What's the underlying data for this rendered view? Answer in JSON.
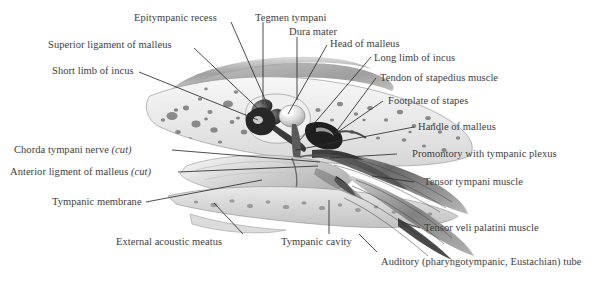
{
  "figure": {
    "kind": "anatomical-illustration",
    "style": "grayscale pen-and-wash medical drawing",
    "background_color": "#ffffff",
    "text_color": "#3d3d3d",
    "leader_line_color": "#2e2e2e"
  },
  "labels": [
    {
      "id": "epitympanic-recess",
      "text": "Epitympanic recess"
    },
    {
      "id": "tegmen-tympani",
      "text": "Tegmen tympani"
    },
    {
      "id": "dura-mater",
      "text": "Dura mater"
    },
    {
      "id": "head-of-malleus",
      "text": "Head of malleus"
    },
    {
      "id": "superior-ligament-of-malleus",
      "text": "Superior ligament of malleus"
    },
    {
      "id": "long-limb-of-incus",
      "text": "Long limb of incus"
    },
    {
      "id": "short-limb-of-incus",
      "text": "Short limb of incus"
    },
    {
      "id": "tendon-of-stapedius-muscle",
      "text": "Tendon of stapedius muscle"
    },
    {
      "id": "footplate-of-stapes",
      "text": "Footplate of stapes"
    },
    {
      "id": "handle-of-malleus",
      "text": "Handle of malleus"
    },
    {
      "id": "chorda-tympani-nerve",
      "text": "Chorda tympani nerve ",
      "suffix_italic": "(cut)"
    },
    {
      "id": "promontory-with-tympanic-plexus",
      "text": "Promontory with tympanic plexus"
    },
    {
      "id": "anterior-ligament-of-malleus",
      "text": "Anterior ligment of malleus ",
      "suffix_italic": "(cut)"
    },
    {
      "id": "tensor-tympani-muscle",
      "text": "Tensor tympani muscle"
    },
    {
      "id": "tympanic-membrane",
      "text": "Tympanic membrane"
    },
    {
      "id": "external-acoustic-meatus",
      "text": "External acoustic meatus"
    },
    {
      "id": "tympanic-cavity",
      "text": "Tympanic cavity"
    },
    {
      "id": "tensor-veli-palatini-muscle",
      "text": "Tensor veli palatini muscle"
    },
    {
      "id": "auditory-tube",
      "text": "Auditory (pharyngotympanic, Eustachian) tube"
    }
  ]
}
